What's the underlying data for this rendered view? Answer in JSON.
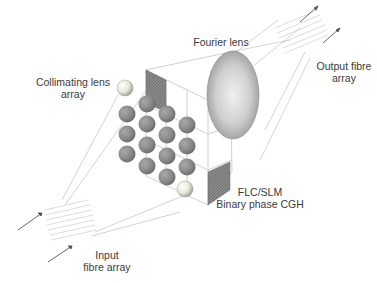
{
  "diagram": {
    "components": [
      {
        "id": "input_fibre_array",
        "label_line1": "Input",
        "label_line2": "fibre array"
      },
      {
        "id": "collimating_lens_array",
        "label_line1": "Collimating lens",
        "label_line2": "array"
      },
      {
        "id": "flc_slm",
        "label_line1": "FLC/SLM",
        "label_line2": "Binary phase CGH"
      },
      {
        "id": "fourier_lens",
        "label_line1": "Fourier lens"
      },
      {
        "id": "output_fibre_array",
        "label_line1": "Output fibre",
        "label_line2": "array"
      }
    ],
    "lens_array": {
      "rows": 4,
      "cols": 4,
      "highlighted_lenses": 2
    },
    "colors": {
      "lens_dark": "#8a8a8a",
      "lens_light": "#e8e8e0",
      "fourier_lens": "#c4c4c4",
      "slm_panel": "#8c8c8c",
      "ray_lines": "#b0b0b0",
      "fibre_arrow": "#555555",
      "text": "#3a3a3a"
    }
  }
}
